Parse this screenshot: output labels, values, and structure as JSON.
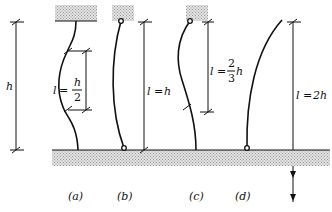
{
  "diagram": {
    "left_dimension": {
      "label": "h"
    },
    "cases": [
      {
        "id": "a",
        "caption": "(a)",
        "effective_length": {
          "lhs": "l",
          "eq": "=",
          "num": "h",
          "den": "2"
        },
        "support": "fixed-fixed"
      },
      {
        "id": "b",
        "caption": "(b)",
        "effective_length": {
          "lhs": "l",
          "eq": "=",
          "rhs": "h"
        },
        "support": "pinned-pinned"
      },
      {
        "id": "c",
        "caption": "(c)",
        "effective_length": {
          "lhs": "l",
          "eq": "=",
          "num": "2",
          "den": "3",
          "suffix": "h"
        },
        "support": "pinned-fixed"
      },
      {
        "id": "d",
        "caption": "(d)",
        "effective_length": {
          "lhs": "l",
          "eq": "=",
          "rhs": "2h"
        },
        "support": "fixed-free"
      }
    ],
    "colors": {
      "ink": "#111111",
      "hatch": "#bdbdbd"
    }
  }
}
